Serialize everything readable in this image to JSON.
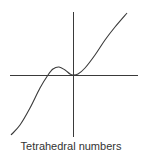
{
  "caption": "Tetrahedral numbers",
  "colors": {
    "line": "#3a3a3a",
    "background": "#ffffff",
    "caption": "#333333"
  },
  "chart_data": {
    "type": "line",
    "title": "Tetrahedral numbers",
    "xlabel": "",
    "ylabel": "",
    "grid": false,
    "legend": "none",
    "function": "T(x) = x(x+1)(x+2)/6",
    "axes": {
      "x_axis_px": {
        "from": [
          10,
          75
        ],
        "to": [
          138,
          75
        ]
      },
      "y_axis_px": {
        "from": [
          73,
          12
        ],
        "to": [
          73,
          137
        ]
      }
    },
    "series": [
      {
        "name": "Tetrahedral numbers curve",
        "points_px": [
          [
            11,
            135
          ],
          [
            20,
            125
          ],
          [
            30,
            108
          ],
          [
            40,
            88
          ],
          [
            48,
            75
          ],
          [
            53,
            69
          ],
          [
            59,
            67
          ],
          [
            65,
            70
          ],
          [
            70,
            74
          ],
          [
            73,
            75
          ],
          [
            78,
            74
          ],
          [
            85,
            68
          ],
          [
            95,
            55
          ],
          [
            105,
            40
          ],
          [
            115,
            27
          ],
          [
            127,
            13
          ]
        ],
        "features": {
          "crosses_x_axis_left": [
            48,
            75
          ],
          "local_max": [
            59,
            67
          ],
          "tangent_at_origin": [
            73,
            75
          ]
        }
      }
    ]
  }
}
